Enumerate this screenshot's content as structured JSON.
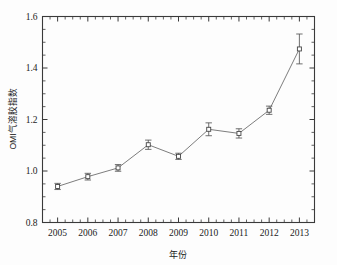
{
  "chart_data": {
    "type": "line",
    "title": "",
    "xlabel": "年份",
    "ylabel": "OMI气溶胶指数",
    "x": [
      2005,
      2006,
      2007,
      2008,
      2009,
      2010,
      2011,
      2012,
      2013
    ],
    "categories": [
      "2005",
      "2006",
      "2007",
      "2008",
      "2009",
      "2010",
      "2011",
      "2012",
      "2013"
    ],
    "values": [
      0.94,
      0.978,
      1.012,
      1.102,
      1.057,
      1.162,
      1.146,
      1.236,
      1.474
    ],
    "errors": [
      0.012,
      0.013,
      0.013,
      0.018,
      0.012,
      0.025,
      0.018,
      0.016,
      0.058
    ],
    "series": [
      {
        "name": "OMI气溶胶指数",
        "values": [
          0.94,
          0.978,
          1.012,
          1.102,
          1.057,
          1.162,
          1.146,
          1.236,
          1.474
        ],
        "errors": [
          0.012,
          0.013,
          0.013,
          0.018,
          0.012,
          0.025,
          0.018,
          0.016,
          0.058
        ]
      }
    ],
    "xlim": [
      2004.5,
      2013.5
    ],
    "ylim": [
      0.8,
      1.6
    ],
    "ytick_labels": [
      "0.8",
      "1.0",
      "1.2",
      "1.4",
      "1.6"
    ],
    "ytick_values": [
      0.8,
      1.0,
      1.2,
      1.4,
      1.6
    ],
    "yminor_step": 0.05,
    "xtick_labels": [
      "2005",
      "2006",
      "2007",
      "2008",
      "2009",
      "2010",
      "2011",
      "2012",
      "2013"
    ],
    "grid": false,
    "legend": false,
    "legend_position": "none",
    "marker": "open-square",
    "line_color": "#6e6e6e",
    "marker_edge_color": "#444444",
    "marker_face_color": "#ffffff",
    "error_bar_color": "#555555",
    "frame": "box",
    "tick_direction": "in"
  },
  "axes": {
    "y_title": "OMI气溶胶指数",
    "x_title": "年份"
  }
}
